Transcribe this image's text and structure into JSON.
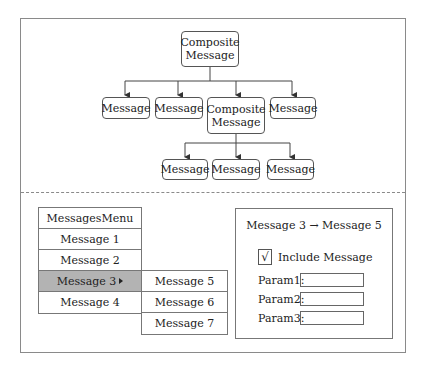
{
  "diagram": {
    "root": {
      "label_line1": "Composite",
      "label_line2": "Message"
    },
    "level1": [
      {
        "label": "Message"
      },
      {
        "label": "Message"
      },
      {
        "label_line1": "Composite",
        "label_line2": "Message"
      },
      {
        "label": "Message"
      }
    ],
    "level2": [
      {
        "label": "Message"
      },
      {
        "label": "Message"
      },
      {
        "label": "Message"
      }
    ]
  },
  "menu": {
    "title": "MessagesMenu",
    "items": [
      {
        "label": "Message 1"
      },
      {
        "label": "Message 2"
      },
      {
        "label": "Message 3",
        "selected": true,
        "has_submenu": true
      },
      {
        "label": "Message 4"
      }
    ],
    "submenu": [
      {
        "label": "Message 5"
      },
      {
        "label": "Message 6"
      },
      {
        "label": "Message 7"
      }
    ]
  },
  "dialog": {
    "title": "Message 3 → Message 5",
    "checkbox": {
      "mark": "√",
      "label": "Include Message",
      "checked": true
    },
    "params": [
      {
        "label": "Param1:",
        "value": ""
      },
      {
        "label": "Param2:",
        "value": ""
      },
      {
        "label": "Param3:",
        "value": ""
      }
    ]
  }
}
